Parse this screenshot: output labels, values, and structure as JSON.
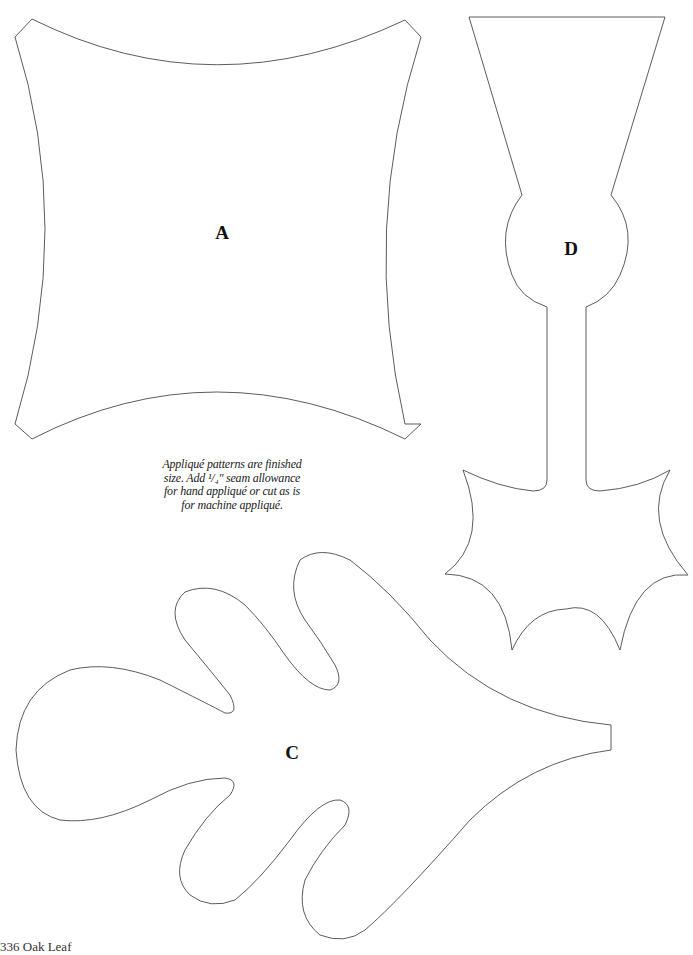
{
  "page": {
    "shapes": [
      {
        "id": "A",
        "label": "A",
        "description": "concave-sided square with clipped corners"
      },
      {
        "id": "D",
        "label": "D",
        "description": "acorn cap and stem shape with trapezoid top, round bulb, narrow stem, and scalloped star base"
      },
      {
        "id": "C",
        "label": "C",
        "description": "oak leaf with wavy lobes and stem"
      }
    ],
    "note": {
      "line1": "Appliqué patterns are finished",
      "line2": "size. Add ¹/₄\" seam allowance",
      "line3": "for hand appliqué or cut as is",
      "line4": "for machine appliqué."
    },
    "footer": {
      "page_number_title": "336 Oak Leaf"
    },
    "colors": {
      "outline": "#4a4a4a",
      "background": "#ffffff",
      "text": "#111111"
    }
  }
}
